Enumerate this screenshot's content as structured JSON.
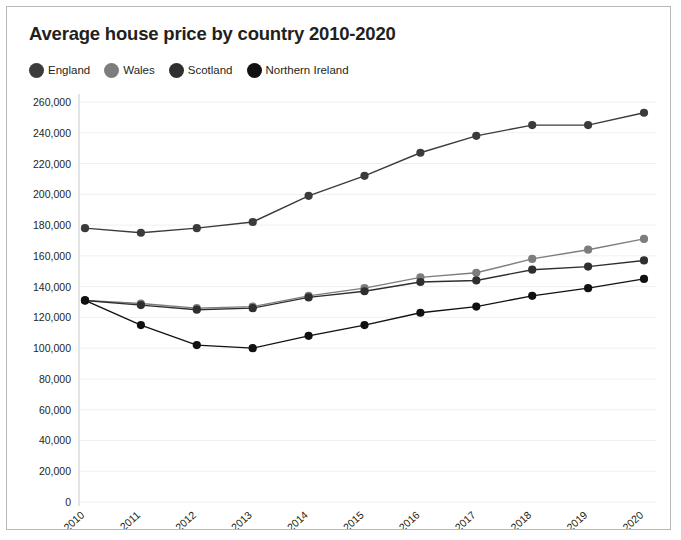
{
  "card": {
    "title": "Average house price by country 2010-2020"
  },
  "legend": [
    {
      "label": "England",
      "color": "#3b3b3b"
    },
    {
      "label": "Wales",
      "color": "#7d7d7d"
    },
    {
      "label": "Scotland",
      "color": "#2f2f2f"
    },
    {
      "label": "Northern Ireland",
      "color": "#111111"
    }
  ],
  "chart_data": {
    "type": "line",
    "title": "Average house price by country 2010-2020",
    "xlabel": "",
    "ylabel": "",
    "categories": [
      "2010",
      "2011",
      "2012",
      "2013",
      "2014",
      "2015",
      "2016",
      "2017",
      "2018",
      "2019",
      "2020"
    ],
    "ylim": [
      0,
      260000
    ],
    "yticks": [
      0,
      20000,
      40000,
      60000,
      80000,
      100000,
      120000,
      140000,
      160000,
      180000,
      200000,
      220000,
      240000,
      260000
    ],
    "ytick_labels": [
      "0",
      "20,000",
      "40,000",
      "60,000",
      "80,000",
      "100,000",
      "120,000",
      "140,000",
      "160,000",
      "180,000",
      "200,000",
      "220,000",
      "240,000",
      "260,000"
    ],
    "grid": true,
    "legend_position": "top-left",
    "markers": "circle",
    "series": [
      {
        "name": "England",
        "color": "#3b3b3b",
        "values": [
          178000,
          175000,
          178000,
          182000,
          199000,
          212000,
          227000,
          238000,
          245000,
          245000,
          253000
        ]
      },
      {
        "name": "Wales",
        "color": "#7d7d7d",
        "values": [
          131000,
          129000,
          126000,
          127000,
          134000,
          139000,
          146000,
          149000,
          158000,
          164000,
          171000
        ]
      },
      {
        "name": "Scotland",
        "color": "#2f2f2f",
        "values": [
          131000,
          128000,
          125000,
          126000,
          133000,
          137000,
          143000,
          144000,
          151000,
          153000,
          157000
        ]
      },
      {
        "name": "Northern Ireland",
        "color": "#111111",
        "values": [
          131000,
          115000,
          102000,
          100000,
          108000,
          115000,
          123000,
          127000,
          134000,
          139000,
          145000
        ]
      }
    ]
  }
}
